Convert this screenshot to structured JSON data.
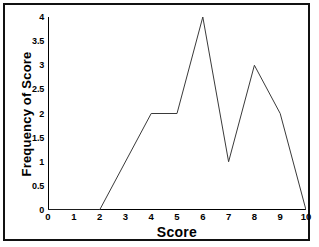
{
  "chart_data": {
    "type": "line",
    "title": "",
    "xlabel": "Score",
    "ylabel": "Frequency of Score",
    "x": [
      0,
      2,
      4,
      5,
      6,
      7,
      8,
      9,
      10
    ],
    "values": [
      0,
      0,
      2,
      2,
      4,
      1,
      3,
      2,
      0
    ],
    "series": [
      {
        "name": "Frequency of Score",
        "x": [
          0,
          2,
          4,
          5,
          6,
          7,
          8,
          9,
          10
        ],
        "values": [
          0,
          0,
          2,
          2,
          4,
          1,
          3,
          2,
          0
        ]
      }
    ],
    "xlim": [
      0,
      10
    ],
    "ylim": [
      0,
      4
    ],
    "xticks": [
      "0",
      "1",
      "2",
      "3",
      "4",
      "5",
      "6",
      "7",
      "8",
      "9",
      "10"
    ],
    "xtick_values": [
      0,
      1,
      2,
      3,
      4,
      5,
      6,
      7,
      8,
      9,
      10
    ],
    "yticks": [
      "0",
      "0.5",
      "1",
      "1.5",
      "2",
      "2.5",
      "3",
      "3.5",
      "4"
    ],
    "ytick_values": [
      0,
      0.5,
      1,
      1.5,
      2,
      2.5,
      3,
      3.5,
      4
    ],
    "grid": false,
    "legend": false,
    "line_color": "#3a3a3a",
    "axis_color": "#000000",
    "background_color": "#ffffff",
    "border_color": "#111111"
  }
}
